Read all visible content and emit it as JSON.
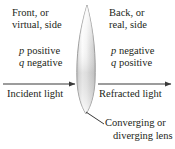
{
  "figure": {
    "background_color": "#ffffff",
    "text_color": "#231f20"
  },
  "labels": {
    "front_side": {
      "line1": "Front, or",
      "line2": "virtual, side"
    },
    "back_side": {
      "line1": "Back, or",
      "line2": "real, side"
    },
    "signs_left": {
      "p_symbol": "p",
      "p_sign": " positive",
      "q_symbol": "q",
      "q_sign": " negative"
    },
    "signs_right": {
      "p_symbol": "p",
      "p_sign": " negative",
      "q_symbol": "q",
      "q_sign": " positive"
    },
    "incident_light": "Incident light",
    "refracted_light": "Refracted light",
    "lens_caption": {
      "line1": "Converging or",
      "line2": "diverging lens"
    }
  },
  "graphics": {
    "lens": {
      "name": "biconvex-lens",
      "top_tip_x": 87,
      "top_tip_y": 5,
      "bottom_tip_x": 86,
      "bottom_tip_y": 114,
      "max_width": 18,
      "outline_color": "#9b9b9b",
      "fill_light": "#fdfdfd",
      "fill_shadow": "#c9c9c9"
    },
    "incident_arrow": {
      "name": "incident-light-arrow",
      "x1": 3,
      "x2": 76,
      "y": 84,
      "color": "#3a3a3a",
      "direction": "right"
    },
    "refracted_arrow": {
      "name": "refracted-light-arrow",
      "x1": 98,
      "x2": 172,
      "y": 84,
      "color": "#3a3a3a",
      "direction": "right"
    },
    "leader_line": {
      "name": "lens-caption-leader-line",
      "x1": 86,
      "y1": 112,
      "x2": 104,
      "y2": 124,
      "color": "#3a3a3a"
    }
  }
}
